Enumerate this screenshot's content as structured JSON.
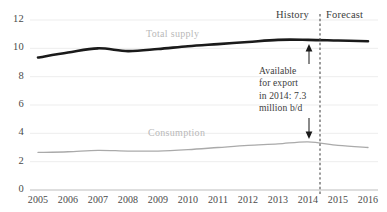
{
  "chart_data": {
    "type": "line",
    "title": "",
    "xlabel": "",
    "ylabel": "",
    "x": [
      2005,
      2006,
      2007,
      2008,
      2009,
      2010,
      2011,
      2012,
      2013,
      2014,
      2015,
      2016
    ],
    "xticklabels": [
      "2005",
      "2006",
      "2007",
      "2008",
      "2009",
      "2010",
      "2011",
      "2012",
      "2013",
      "2014",
      "2015",
      "2016"
    ],
    "yticklabels": [
      "0",
      "2",
      "4",
      "6",
      "8",
      "10",
      "12"
    ],
    "yticks": [
      0,
      2,
      4,
      6,
      8,
      10,
      12
    ],
    "ylim": [
      0,
      12
    ],
    "xlim": [
      2005,
      2016
    ],
    "grid": true,
    "legend_position": "inline-series-labels",
    "series": [
      {
        "name": "Total supply",
        "color": "#1a1a1a",
        "values": [
          9.35,
          9.7,
          10.0,
          9.8,
          9.95,
          10.15,
          10.3,
          10.45,
          10.6,
          10.6,
          10.55,
          10.5
        ]
      },
      {
        "name": "Consumption",
        "color": "#aaaaaa",
        "values": [
          2.65,
          2.7,
          2.8,
          2.75,
          2.75,
          2.85,
          3.0,
          3.15,
          3.25,
          3.4,
          3.15,
          3.0
        ]
      }
    ],
    "annotations": [
      {
        "name": "available-for-export",
        "lines": [
          "Available",
          "for export",
          "in 2014: 7.3",
          "million b/d"
        ],
        "value": 7.3,
        "unit": "million b/d",
        "year": 2014,
        "arrow": "double-headed-vertical"
      }
    ],
    "divider": {
      "name": "history-forecast-divider",
      "at_x": 2014.5,
      "style": "dashed",
      "left_label": "History",
      "right_label": "Forecast"
    }
  },
  "labels": {
    "history": "History",
    "forecast": "Forecast",
    "total_supply": "Total supply",
    "consumption": "Consumption"
  },
  "callout": {
    "line1": "Available",
    "line2": "for export",
    "line3": "in 2014: 7.3",
    "line4": "million b/d"
  },
  "colors": {
    "supply_line": "#1a1a1a",
    "consumption_line": "#aaaaaa",
    "grid": "#e8e8e8",
    "axis": "#b0b0b0",
    "text": "#3c3c3c",
    "series_label": "#b9b9b9"
  }
}
